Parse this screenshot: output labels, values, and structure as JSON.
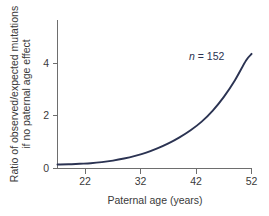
{
  "chart_data": {
    "type": "line",
    "title": "",
    "xlabel": "Paternal age (years)",
    "ylabel": "Ratio of observed/expected mutations if no paternal age effect",
    "ylabel_line1": "Ratio of observed/expected mutations",
    "ylabel_line2": "if no paternal age effect",
    "xlim": [
      17,
      52
    ],
    "ylim": [
      0,
      4.9
    ],
    "xticks": [
      22,
      32,
      42,
      52
    ],
    "xtick_labels": [
      "22",
      "32",
      "42",
      "52"
    ],
    "yticks": [
      0,
      2,
      4
    ],
    "ytick_labels": [
      "0",
      "2",
      "4"
    ],
    "grid": false,
    "legend": "none",
    "annotations": [
      {
        "text_italic": "n",
        "text_rest": " = 152",
        "text": "n = 152",
        "x": 44.5,
        "y": 4.25
      }
    ],
    "series": [
      {
        "name": "Ratio of observed/expected mutations",
        "color": "#2b3352",
        "x": [
          17,
          19,
          21,
          23,
          25,
          27,
          29,
          31,
          33,
          35,
          37,
          39,
          41,
          43,
          45,
          47,
          49,
          51,
          52
        ],
        "values": [
          0.15,
          0.16,
          0.18,
          0.2,
          0.24,
          0.3,
          0.38,
          0.48,
          0.6,
          0.76,
          0.95,
          1.18,
          1.45,
          1.78,
          2.2,
          2.72,
          3.35,
          4.1,
          4.35
        ]
      }
    ]
  },
  "figure": {
    "axis_color": "#6e6e6e",
    "text_color": "#3a3a3a",
    "curve_color": "#2b3352",
    "background": "#ffffff"
  }
}
